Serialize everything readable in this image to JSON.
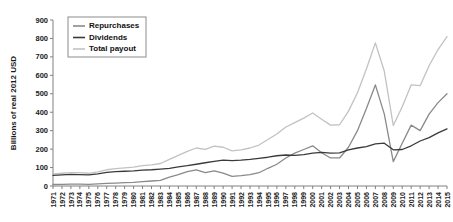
{
  "chart_data": {
    "type": "line",
    "title": "",
    "xlabel": "",
    "ylabel": "Billions of real 2012 USD",
    "ylim": [
      0,
      900
    ],
    "ytick_step": 100,
    "yticks": [
      0,
      100,
      200,
      300,
      400,
      500,
      600,
      700,
      800,
      900
    ],
    "grid": false,
    "legend_position": "top-left",
    "x": [
      1971,
      1972,
      1973,
      1974,
      1975,
      1976,
      1977,
      1978,
      1979,
      1980,
      1981,
      1982,
      1983,
      1984,
      1985,
      1986,
      1987,
      1988,
      1989,
      1990,
      1991,
      1992,
      1993,
      1994,
      1995,
      1996,
      1997,
      1998,
      1999,
      2000,
      2001,
      2002,
      2003,
      2004,
      2005,
      2006,
      2007,
      2008,
      2009,
      2010,
      2011,
      2012,
      2013,
      2014,
      2015
    ],
    "series": [
      {
        "name": "Repurchases",
        "color": "#8a8a8a",
        "values": [
          8,
          9,
          10,
          10,
          9,
          11,
          14,
          16,
          18,
          20,
          24,
          27,
          30,
          48,
          62,
          78,
          88,
          72,
          82,
          70,
          52,
          56,
          62,
          72,
          96,
          118,
          152,
          178,
          198,
          218,
          180,
          152,
          152,
          210,
          300,
          420,
          548,
          390,
          132,
          232,
          330,
          300,
          390,
          452,
          500
        ]
      },
      {
        "name": "Dividends",
        "color": "#3a3a3a",
        "values": [
          58,
          60,
          63,
          62,
          60,
          66,
          74,
          78,
          80,
          82,
          86,
          88,
          92,
          96,
          104,
          110,
          118,
          126,
          134,
          140,
          138,
          140,
          144,
          150,
          156,
          164,
          168,
          166,
          170,
          178,
          182,
          178,
          180,
          196,
          206,
          214,
          228,
          232,
          196,
          198,
          218,
          244,
          262,
          288,
          310
        ]
      },
      {
        "name": "Total payout",
        "color": "#c2c2c2",
        "values": [
          66,
          69,
          73,
          72,
          69,
          77,
          88,
          94,
          98,
          102,
          110,
          115,
          122,
          144,
          166,
          188,
          206,
          198,
          216,
          210,
          190,
          196,
          206,
          222,
          252,
          282,
          320,
          344,
          368,
          396,
          362,
          330,
          332,
          406,
          506,
          634,
          776,
          622,
          328,
          430,
          548,
          544,
          652,
          740,
          810
        ]
      }
    ],
    "legend": [
      {
        "label": "Repurchases"
      },
      {
        "label": "Dividends"
      },
      {
        "label": "Total payout"
      }
    ]
  }
}
